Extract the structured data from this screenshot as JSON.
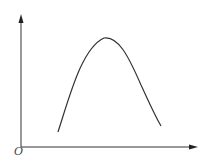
{
  "diagram": {
    "origin_label": "O",
    "colors": {
      "axis": "#333333",
      "curve": "#333333",
      "label": "#444444"
    },
    "axes": {
      "origin": [
        21,
        147
      ],
      "y_axis_top": [
        21,
        15
      ],
      "x_axis_end": [
        197,
        147
      ]
    },
    "curve": {
      "description": "asymmetric hump curve rising from lower-left to a peak then falling to lower-right",
      "start": [
        58,
        132
      ],
      "peak": [
        104,
        38
      ],
      "end": [
        161,
        126
      ]
    }
  }
}
